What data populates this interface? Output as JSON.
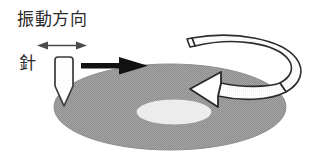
{
  "figure": {
    "type": "diagram",
    "width": 316,
    "height": 157,
    "background_color": "#ffffff"
  },
  "labels": {
    "vibration_direction": "振動方向",
    "needle": "針"
  },
  "colors": {
    "disc_fill": "#9d9d9d",
    "disc_edge": "#8a8a8a",
    "disc_label_fill": "#eeeeee",
    "disc_label_edge": "#9a9a9a",
    "stylus_fill": "#fdfdfd",
    "stylus_stroke": "#3a3a3a",
    "motion_arrow_fill": "#111111",
    "rotation_arrow_fill": "#ffffff",
    "rotation_arrow_stroke": "#2b2b2b",
    "vibration_arrow_stroke": "#4a4a4a",
    "text_color": "#2b2b2b"
  },
  "elements": {
    "record_disc": {
      "name": "record-disc",
      "cx": 170,
      "cy": 107,
      "rx": 116,
      "ry": 43
    },
    "record_label": {
      "name": "record-center-label",
      "cx": 174,
      "cy": 112,
      "rx": 38,
      "ry": 13
    },
    "stylus": {
      "name": "stylus-needle",
      "tip_x": 63,
      "tip_y": 106,
      "body_top_y": 57,
      "body_width": 17
    },
    "motion_arrow": {
      "name": "tracking-direction-arrow",
      "from_x": 81,
      "to_x": 147,
      "y": 66
    },
    "vibration_arrow": {
      "name": "vibration-double-arrow",
      "from_x": 38,
      "to_x": 86,
      "y": 46
    },
    "rotation_arrow": {
      "name": "rotation-direction-arrow",
      "direction": "counterclockwise-viewed-from-above"
    }
  }
}
